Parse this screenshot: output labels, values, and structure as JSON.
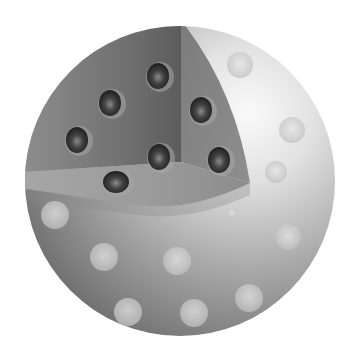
{
  "figure": {
    "width": 358,
    "height": 357,
    "background": "#ffffff",
    "sphere": {
      "cx": 180,
      "cy": 181,
      "r": 155
    },
    "colors": {
      "sphere_light": "#f4f4f4",
      "sphere_mid": "#b4b4b4",
      "sphere_dark": "#6e6e6e",
      "wedge_back": "#7a7a7a",
      "wedge_back_dark": "#5a5a5a",
      "wedge_floor": "#9a9a9a",
      "wedge_side": "#8c8c8c",
      "inner_particle": "#2a2a2a",
      "inner_particle_highlight": "#8a8a8a",
      "surface_particle": "#d2d2d2"
    },
    "inner_particles": [
      {
        "cx": 158,
        "cy": 76,
        "rx": 11,
        "ry": 13
      },
      {
        "cx": 110,
        "cy": 103,
        "rx": 11,
        "ry": 13
      },
      {
        "cx": 201,
        "cy": 110,
        "rx": 11,
        "ry": 13
      },
      {
        "cx": 77,
        "cy": 140,
        "rx": 11,
        "ry": 13
      },
      {
        "cx": 159,
        "cy": 157,
        "rx": 11,
        "ry": 13
      },
      {
        "cx": 219,
        "cy": 160,
        "rx": 11,
        "ry": 13
      },
      {
        "cx": 116,
        "cy": 182,
        "rx": 13,
        "ry": 11
      }
    ],
    "surface_particles": [
      {
        "cx": 240,
        "cy": 65,
        "r": 13
      },
      {
        "cx": 292,
        "cy": 130,
        "r": 13
      },
      {
        "cx": 276,
        "cy": 172,
        "r": 11
      },
      {
        "cx": 55,
        "cy": 215,
        "r": 14
      },
      {
        "cx": 232,
        "cy": 213,
        "r": 5
      },
      {
        "cx": 288,
        "cy": 237,
        "r": 13
      },
      {
        "cx": 104,
        "cy": 257,
        "r": 14
      },
      {
        "cx": 177,
        "cy": 261,
        "r": 14
      },
      {
        "cx": 128,
        "cy": 312,
        "r": 14
      },
      {
        "cx": 194,
        "cy": 313,
        "r": 14
      },
      {
        "cx": 249,
        "cy": 298,
        "r": 14
      }
    ]
  }
}
